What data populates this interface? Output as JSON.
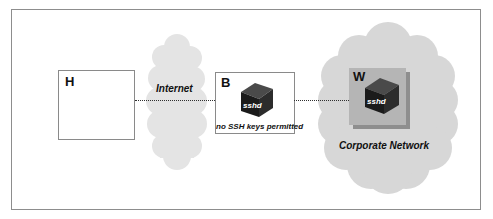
{
  "figure": {
    "kind": "network-diagram",
    "border_color": "#8d8d8d",
    "background": "#ffffff"
  },
  "nodes": {
    "host": {
      "label": "H",
      "name": "host-box",
      "fill": "#ffffff",
      "border": "#8a8a8a"
    },
    "bastion": {
      "label": "B",
      "name": "bastion-box",
      "caption": "no SSH keys permitted",
      "daemon": "sshd",
      "fill": "#ffffff",
      "border": "#8a8a8a"
    },
    "workstation": {
      "label": "W",
      "name": "corporate-workstation-panel",
      "daemon": "sshd",
      "fill": "#b5b5b5",
      "shadow": "#8e8e8e"
    }
  },
  "clouds": {
    "internet": {
      "label": "Internet",
      "fill": "#e4e4e4"
    },
    "corporate": {
      "label": "Corporate Network",
      "fill": "#d7d7d7"
    }
  },
  "links": {
    "host_to_internet": {
      "name": "link-host-to-internet",
      "style": "dotted",
      "color": "#2f2f2f"
    },
    "bastion_to_corporate": {
      "name": "link-bastion-to-corporate",
      "style": "dotted",
      "color": "#2f2f2f"
    }
  },
  "icons": {
    "cube_front": "#1b1b1b",
    "cube_top": "#4a4a4a",
    "cube_side": "#2c2c2c"
  }
}
